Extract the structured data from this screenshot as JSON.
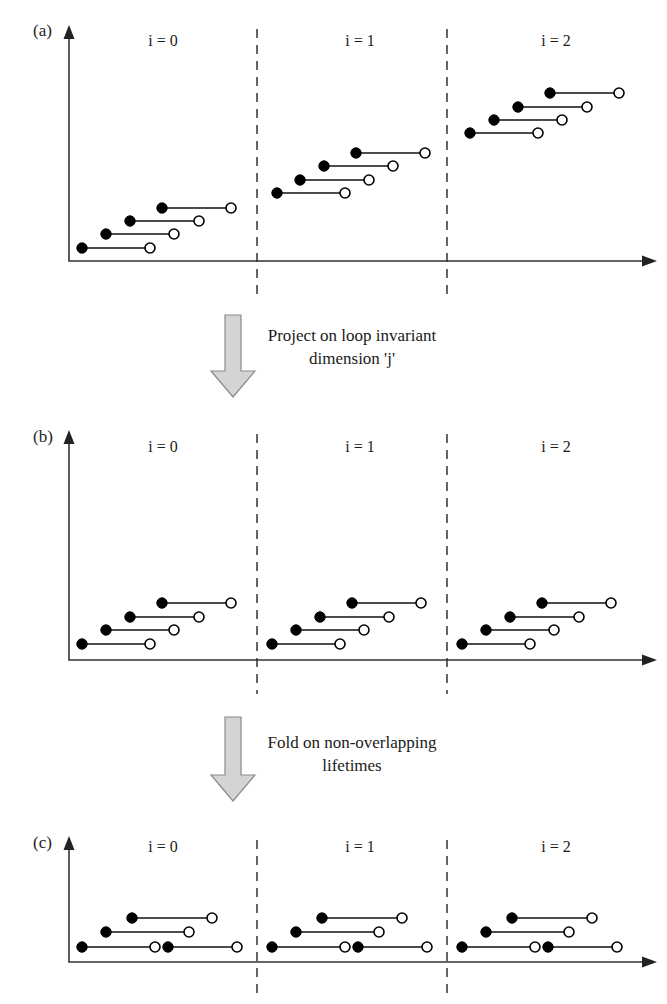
{
  "figure": {
    "type": "diagram",
    "width": 667,
    "height": 1004,
    "background_color": "#ffffff",
    "line_color": "#111111",
    "arrow_fill_color": "#d4d4d4",
    "arrow_stroke_color": "#8a8a8a"
  },
  "panels": [
    {
      "id": "a",
      "label": "(a)",
      "label_x": 33,
      "label_y": 36,
      "axis": {
        "origin_x": 69,
        "baseline_y": 261,
        "top_y": 25,
        "right_x": 657
      },
      "dividers": [
        257,
        447
      ],
      "sections": [
        {
          "label": "i = 0",
          "label_x": 163,
          "label_y": 46,
          "segments": [
            {
              "start_x": 82,
              "end_x": 150,
              "y": 248
            },
            {
              "start_x": 106,
              "end_x": 174,
              "y": 234
            },
            {
              "start_x": 130,
              "end_x": 199,
              "y": 221
            },
            {
              "start_x": 162,
              "end_x": 231,
              "y": 208
            }
          ]
        },
        {
          "label": "i = 1",
          "label_x": 360,
          "label_y": 46,
          "segments": [
            {
              "start_x": 277,
              "end_x": 345,
              "y": 193
            },
            {
              "start_x": 300,
              "end_x": 369,
              "y": 180
            },
            {
              "start_x": 324,
              "end_x": 393,
              "y": 166
            },
            {
              "start_x": 356,
              "end_x": 425,
              "y": 153
            }
          ]
        },
        {
          "label": "i = 2",
          "label_x": 556,
          "label_y": 46,
          "segments": [
            {
              "start_x": 470,
              "end_x": 538,
              "y": 133
            },
            {
              "start_x": 494,
              "end_x": 562,
              "y": 120
            },
            {
              "start_x": 518,
              "end_x": 587,
              "y": 107
            },
            {
              "start_x": 550,
              "end_x": 619,
              "y": 93
            }
          ]
        }
      ]
    },
    {
      "id": "b",
      "label": "(b)",
      "label_x": 33,
      "label_y": 442,
      "axis": {
        "origin_x": 69,
        "baseline_y": 660,
        "top_y": 430,
        "right_x": 657
      },
      "dividers": [
        257,
        447
      ],
      "sections": [
        {
          "label": "i = 0",
          "label_x": 163,
          "label_y": 452,
          "segments": [
            {
              "start_x": 82,
              "end_x": 150,
              "y": 644
            },
            {
              "start_x": 106,
              "end_x": 174,
              "y": 630
            },
            {
              "start_x": 130,
              "end_x": 199,
              "y": 617
            },
            {
              "start_x": 162,
              "end_x": 231,
              "y": 603
            }
          ]
        },
        {
          "label": "i = 1",
          "label_x": 360,
          "label_y": 452,
          "segments": [
            {
              "start_x": 272,
              "end_x": 340,
              "y": 644
            },
            {
              "start_x": 296,
              "end_x": 364,
              "y": 630
            },
            {
              "start_x": 320,
              "end_x": 389,
              "y": 617
            },
            {
              "start_x": 352,
              "end_x": 421,
              "y": 603
            }
          ]
        },
        {
          "label": "i = 2",
          "label_x": 556,
          "label_y": 452,
          "segments": [
            {
              "start_x": 462,
              "end_x": 530,
              "y": 644
            },
            {
              "start_x": 486,
              "end_x": 554,
              "y": 630
            },
            {
              "start_x": 510,
              "end_x": 579,
              "y": 617
            },
            {
              "start_x": 542,
              "end_x": 611,
              "y": 603
            }
          ]
        }
      ]
    },
    {
      "id": "c",
      "label": "(c)",
      "label_x": 33,
      "label_y": 848,
      "axis": {
        "origin_x": 69,
        "baseline_y": 962,
        "top_y": 836,
        "right_x": 657
      },
      "dividers": [
        257,
        447
      ],
      "sections": [
        {
          "label": "i = 0",
          "label_x": 163,
          "label_y": 852,
          "segments": [
            {
              "start_x": 82,
              "end_x": 155,
              "y": 947
            },
            {
              "start_x": 168,
              "end_x": 237,
              "y": 947
            },
            {
              "start_x": 106,
              "end_x": 189,
              "y": 932
            },
            {
              "start_x": 132,
              "end_x": 212,
              "y": 918
            }
          ]
        },
        {
          "label": "i = 1",
          "label_x": 360,
          "label_y": 852,
          "segments": [
            {
              "start_x": 272,
              "end_x": 345,
              "y": 947
            },
            {
              "start_x": 358,
              "end_x": 427,
              "y": 947
            },
            {
              "start_x": 296,
              "end_x": 379,
              "y": 932
            },
            {
              "start_x": 322,
              "end_x": 402,
              "y": 918
            }
          ]
        },
        {
          "label": "i = 2",
          "label_x": 556,
          "label_y": 852,
          "segments": [
            {
              "start_x": 462,
              "end_x": 535,
              "y": 947
            },
            {
              "start_x": 548,
              "end_x": 617,
              "y": 947
            },
            {
              "start_x": 486,
              "end_x": 569,
              "y": 932
            },
            {
              "start_x": 512,
              "end_x": 592,
              "y": 918
            }
          ]
        }
      ]
    }
  ],
  "annotations": [
    {
      "id": "project",
      "line1": "Project on loop invariant",
      "line2": "dimension 'j'",
      "text_x": 352,
      "line1_y": 341,
      "line2_y": 364,
      "arrow": {
        "shaft_left": 225,
        "shaft_right": 241,
        "top_y": 315,
        "head_top_y": 371,
        "head_left": 211,
        "head_right": 255,
        "tip_y": 397
      }
    },
    {
      "id": "fold",
      "line1": "Fold on non-overlapping",
      "line2": "lifetimes",
      "text_x": 352,
      "line1_y": 748,
      "line2_y": 771,
      "arrow": {
        "shaft_left": 225,
        "shaft_right": 241,
        "top_y": 717,
        "head_top_y": 775,
        "head_left": 211,
        "head_right": 255,
        "tip_y": 801
      }
    }
  ],
  "markers": {
    "start_radius": 5.2,
    "end_radius": 5.0,
    "start_kind": "filled-circle",
    "end_kind": "open-circle"
  }
}
